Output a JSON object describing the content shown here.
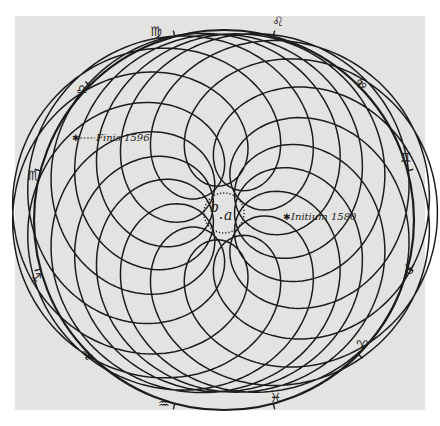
{
  "figure": {
    "background_color": "#e3e3e1",
    "ink_color": "#1c1c1c",
    "annotations": {
      "start": "Initium 1580",
      "end": "Finis 1596",
      "center_point_a": "a",
      "center_point_b": "b"
    },
    "zodiac": [
      {
        "sign": "Leo",
        "glyph": "♌"
      },
      {
        "sign": "Virgo",
        "glyph": "♍"
      },
      {
        "sign": "Libra",
        "glyph": "♎"
      },
      {
        "sign": "Scorpio",
        "glyph": "♏"
      },
      {
        "sign": "Sagittarius",
        "glyph": "♐"
      },
      {
        "sign": "Capricorn",
        "glyph": "♑"
      },
      {
        "sign": "Aquarius",
        "glyph": "♒"
      },
      {
        "sign": "Pisces",
        "glyph": "♓"
      },
      {
        "sign": "Aries",
        "glyph": "♈"
      },
      {
        "sign": "Taurus",
        "glyph": "♉"
      },
      {
        "sign": "Gemini",
        "glyph": "♊"
      },
      {
        "sign": "Cancer",
        "glyph": "♋"
      }
    ]
  }
}
